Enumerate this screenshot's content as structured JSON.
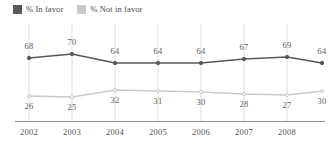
{
  "legend": {
    "position": "top-left",
    "items": [
      {
        "label": "% In favor",
        "color": "#595959",
        "icon": "square-swatch-icon"
      },
      {
        "label": "% Not in favor",
        "color": "#c9c9c9",
        "icon": "square-swatch-icon"
      }
    ]
  },
  "chart_data": {
    "type": "line",
    "title": "",
    "subtitle": "",
    "xlabel": "",
    "ylabel": "",
    "grid": true,
    "gridlines": "vertical",
    "legend_position": "top-left",
    "ylim": [
      0,
      100
    ],
    "x": [
      2002,
      2003,
      2004,
      2005,
      2006,
      2007,
      2008,
      2009
    ],
    "tick_labels": [
      "2002",
      "2003",
      "2004",
      "2005",
      "2006",
      "2007",
      "2008"
    ],
    "series": [
      {
        "name": "% In favor",
        "color": "#595959",
        "values": [
          68,
          70,
          64,
          64,
          64,
          67,
          69,
          64
        ],
        "label_position": "above"
      },
      {
        "name": "% Not in favor",
        "color": "#c9c9c9",
        "values": [
          26,
          25,
          32,
          31,
          30,
          28,
          27,
          30
        ],
        "label_position": "below"
      }
    ]
  },
  "geometry": {
    "point_x": [
      29,
      72,
      115,
      158,
      201,
      244,
      287,
      322
    ],
    "gridline_x": [
      29,
      72,
      115,
      158,
      201,
      244,
      287
    ],
    "tick_label_x": [
      29,
      72,
      115,
      158,
      201,
      244,
      287
    ],
    "in_favor_y": [
      58,
      54,
      63,
      63,
      63,
      59,
      57,
      63
    ],
    "not_favor_y": [
      96,
      97,
      90,
      91,
      92,
      94,
      95,
      91
    ],
    "in_favor_label_y": [
      42,
      38,
      47,
      47,
      47,
      43,
      41,
      47
    ],
    "not_favor_label_y": [
      102,
      103,
      96,
      97,
      98,
      100,
      101,
      97
    ],
    "axis_y": 121
  }
}
